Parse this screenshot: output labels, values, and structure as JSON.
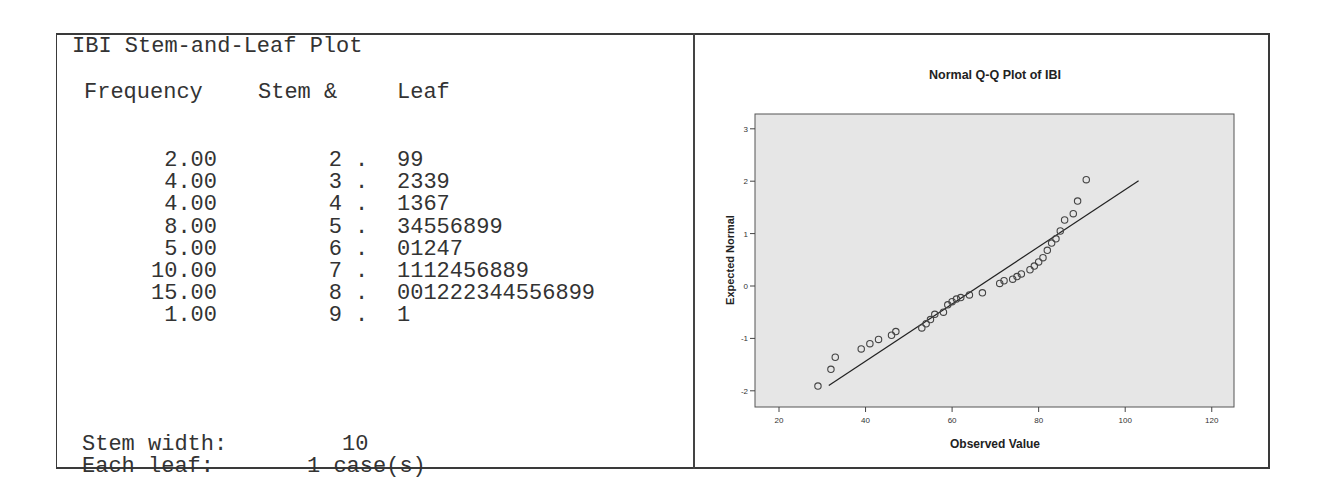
{
  "stem_leaf": {
    "title": "IBI Stem-and-Leaf Plot",
    "headers": {
      "frequency": "Frequency",
      "stem": "Stem &",
      "leaf": "Leaf"
    },
    "rows": [
      {
        "frequency": "2.00",
        "stem": "2",
        "dot": ".",
        "leaf": "99"
      },
      {
        "frequency": "4.00",
        "stem": "3",
        "dot": ".",
        "leaf": "2339"
      },
      {
        "frequency": "4.00",
        "stem": "4",
        "dot": ".",
        "leaf": "1367"
      },
      {
        "frequency": "8.00",
        "stem": "5",
        "dot": ".",
        "leaf": "34556899"
      },
      {
        "frequency": "5.00",
        "stem": "6",
        "dot": ".",
        "leaf": "01247"
      },
      {
        "frequency": "10.00",
        "stem": "7",
        "dot": ".",
        "leaf": "1112456889"
      },
      {
        "frequency": "15.00",
        "stem": "8",
        "dot": ".",
        "leaf": "001222344556899"
      },
      {
        "frequency": "1.00",
        "stem": "9",
        "dot": ".",
        "leaf": "1"
      }
    ],
    "stem_width_label": "Stem width:",
    "stem_width_value": "10",
    "each_leaf_label": "Each leaf:",
    "each_leaf_value": "1 case(s)"
  },
  "chart_data": {
    "type": "scatter",
    "title": "Normal Q-Q Plot of IBI",
    "xlabel": "Observed Value",
    "ylabel": "Expected Normal",
    "xlim": [
      15,
      125
    ],
    "ylim": [
      -2.3,
      3.3
    ],
    "xticks": [
      20,
      40,
      60,
      80,
      100,
      120
    ],
    "yticks": [
      3,
      2,
      1,
      0,
      -1,
      -2
    ],
    "grid": false,
    "colors": {
      "plot_bg": "#e6e6e6",
      "marker": "#444444",
      "line": "#222222"
    },
    "reference_line": {
      "x": [
        31.5,
        103.1
      ],
      "y": [
        -1.9,
        2.01
      ]
    },
    "points": [
      {
        "x": 29,
        "y": -1.91
      },
      {
        "x": 32,
        "y": -1.59
      },
      {
        "x": 33,
        "y": -1.36
      },
      {
        "x": 39,
        "y": -1.2
      },
      {
        "x": 41,
        "y": -1.1
      },
      {
        "x": 43,
        "y": -1.02
      },
      {
        "x": 46,
        "y": -0.94
      },
      {
        "x": 47,
        "y": -0.87
      },
      {
        "x": 53,
        "y": -0.8
      },
      {
        "x": 54,
        "y": -0.72
      },
      {
        "x": 55,
        "y": -0.64
      },
      {
        "x": 56,
        "y": -0.54
      },
      {
        "x": 58,
        "y": -0.5
      },
      {
        "x": 59,
        "y": -0.36
      },
      {
        "x": 60,
        "y": -0.3
      },
      {
        "x": 61,
        "y": -0.25
      },
      {
        "x": 62,
        "y": -0.22
      },
      {
        "x": 64,
        "y": -0.17
      },
      {
        "x": 67,
        "y": -0.13
      },
      {
        "x": 71,
        "y": 0.05
      },
      {
        "x": 72,
        "y": 0.1
      },
      {
        "x": 74,
        "y": 0.13
      },
      {
        "x": 75,
        "y": 0.18
      },
      {
        "x": 76,
        "y": 0.23
      },
      {
        "x": 78,
        "y": 0.31
      },
      {
        "x": 79,
        "y": 0.38
      },
      {
        "x": 80,
        "y": 0.46
      },
      {
        "x": 81,
        "y": 0.54
      },
      {
        "x": 82,
        "y": 0.68
      },
      {
        "x": 83,
        "y": 0.82
      },
      {
        "x": 84,
        "y": 0.9
      },
      {
        "x": 85,
        "y": 1.05
      },
      {
        "x": 86,
        "y": 1.26
      },
      {
        "x": 88,
        "y": 1.38
      },
      {
        "x": 89,
        "y": 1.62
      },
      {
        "x": 91,
        "y": 2.03
      }
    ]
  }
}
